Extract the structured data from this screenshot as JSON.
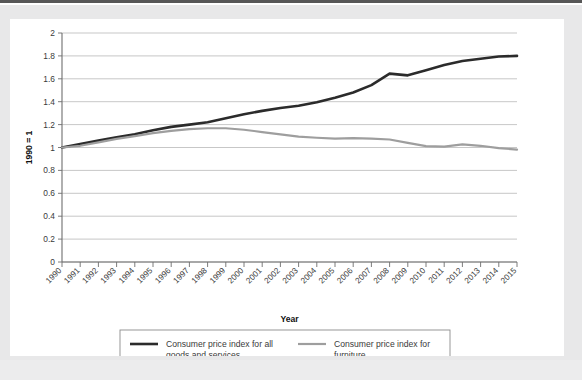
{
  "figure": {
    "background_outer": "#e8e8e9",
    "background_panel": "#ffffff",
    "border_color": "#8c8c8c"
  },
  "chart_data": {
    "type": "line",
    "title": "",
    "subtitle": "",
    "xlabel": "Year",
    "ylabel": "1990 = 1",
    "xlim": [
      1990,
      2015
    ],
    "ylim": [
      0,
      2
    ],
    "ytick_labels": [
      "0",
      "0.2",
      "0.4",
      "0.6",
      "0.8",
      "1",
      "1.2",
      "1.4",
      "1.6",
      "1.8",
      "2"
    ],
    "ytick_values": [
      0,
      0.2,
      0.4,
      0.6,
      0.8,
      1,
      1.2,
      1.4,
      1.6,
      1.8,
      2
    ],
    "grid": true,
    "grid_axis": "y",
    "legend_position": "bottom",
    "categories": [
      1990,
      1991,
      1992,
      1993,
      1994,
      1995,
      1996,
      1997,
      1998,
      1999,
      2000,
      2001,
      2002,
      2003,
      2004,
      2005,
      2006,
      2007,
      2008,
      2009,
      2010,
      2011,
      2012,
      2013,
      2014,
      2015
    ],
    "xtick_labels": [
      "1990",
      "1991",
      "1992",
      "1993",
      "1994",
      "1995",
      "1996",
      "1997",
      "1998",
      "1999",
      "2000",
      "2001",
      "2002",
      "2003",
      "2004",
      "2005",
      "2006",
      "2007",
      "2008",
      "2009",
      "2010",
      "2011",
      "2012",
      "2013",
      "2014",
      "2015"
    ],
    "series": [
      {
        "name": "Consumer price index for all goods and services",
        "color": "#2b2b2b",
        "width": 2.6,
        "values": [
          1.0,
          1.03,
          1.06,
          1.09,
          1.115,
          1.15,
          1.18,
          1.2,
          1.22,
          1.255,
          1.29,
          1.32,
          1.345,
          1.365,
          1.395,
          1.435,
          1.48,
          1.545,
          1.645,
          1.63,
          1.675,
          1.72,
          1.755,
          1.775,
          1.795,
          1.8
        ]
      },
      {
        "name": "Consumer price index for furniture",
        "color": "#9e9e9e",
        "width": 2.2,
        "values": [
          1.0,
          1.015,
          1.045,
          1.075,
          1.1,
          1.125,
          1.145,
          1.16,
          1.168,
          1.168,
          1.155,
          1.135,
          1.115,
          1.095,
          1.085,
          1.078,
          1.082,
          1.078,
          1.07,
          1.04,
          1.012,
          1.008,
          1.028,
          1.015,
          0.995,
          0.982
        ]
      }
    ]
  },
  "legend": {
    "entries": [
      {
        "label_line1": "Consumer price index for all",
        "label_line2": "goods and services",
        "color": "#2b2b2b"
      },
      {
        "label_line1": "Consumer price index for",
        "label_line2": "furniture",
        "color": "#9e9e9e"
      }
    ]
  }
}
